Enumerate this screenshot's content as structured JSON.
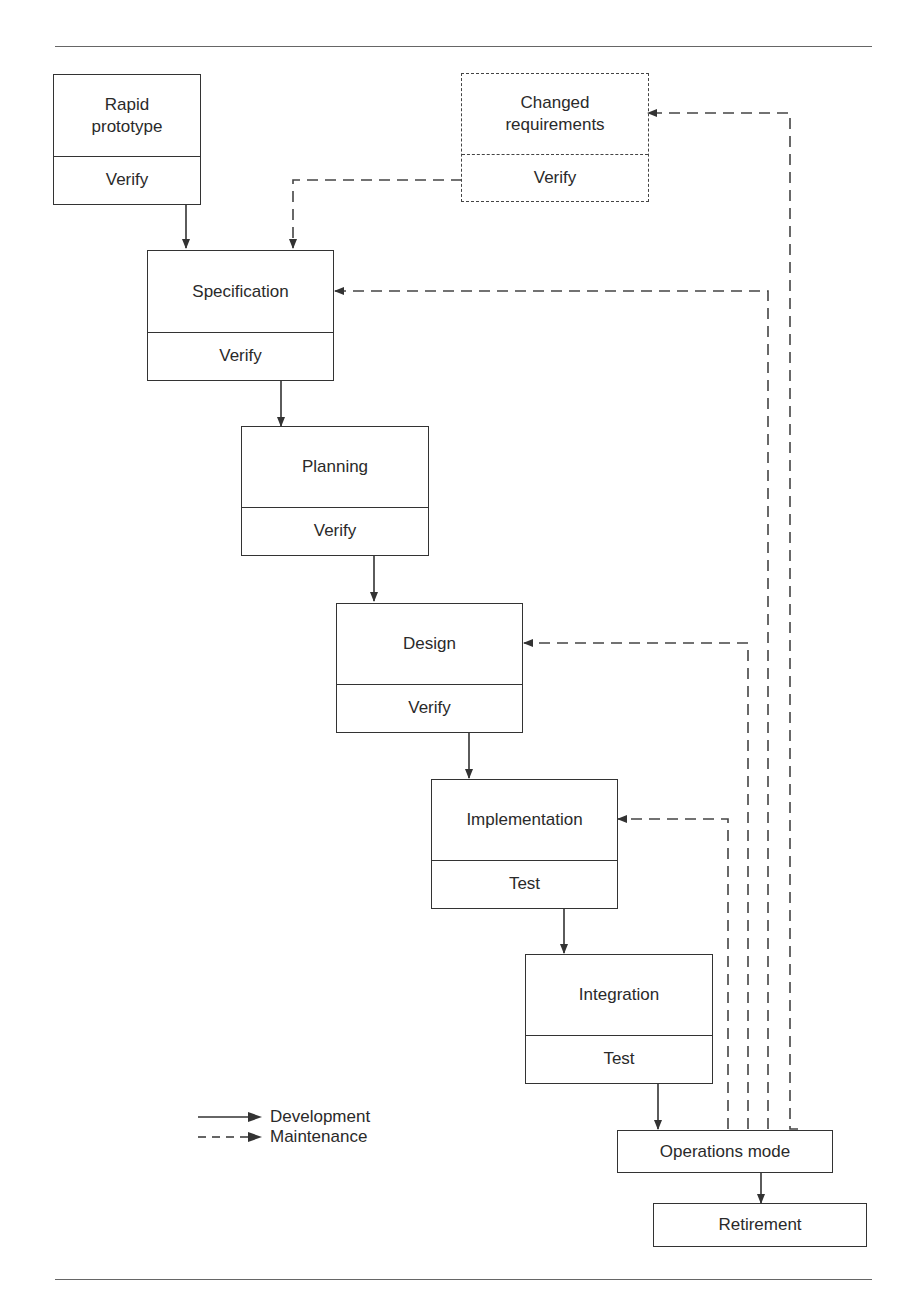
{
  "diagram": {
    "type": "rapid-prototyping life-cycle model",
    "nodes": [
      {
        "id": "rapid_prototype",
        "title": "Rapid\nprototype",
        "sub": "Verify",
        "style": "solid"
      },
      {
        "id": "changed_requirements",
        "title": "Changed\nrequirements",
        "sub": "Verify",
        "style": "dashed"
      },
      {
        "id": "specification",
        "title": "Specification",
        "sub": "Verify",
        "style": "solid"
      },
      {
        "id": "planning",
        "title": "Planning",
        "sub": "Verify",
        "style": "solid"
      },
      {
        "id": "design",
        "title": "Design",
        "sub": "Verify",
        "style": "solid"
      },
      {
        "id": "implementation",
        "title": "Implementation",
        "sub": "Test",
        "style": "solid"
      },
      {
        "id": "integration",
        "title": "Integration",
        "sub": "Test",
        "style": "solid"
      },
      {
        "id": "operations_mode",
        "title": "Operations mode",
        "style": "solid"
      },
      {
        "id": "retirement",
        "title": "Retirement",
        "style": "solid"
      }
    ],
    "edges": [
      {
        "from": "rapid_prototype",
        "to": "specification",
        "kind": "development"
      },
      {
        "from": "specification",
        "to": "planning",
        "kind": "development"
      },
      {
        "from": "planning",
        "to": "design",
        "kind": "development"
      },
      {
        "from": "design",
        "to": "implementation",
        "kind": "development"
      },
      {
        "from": "implementation",
        "to": "integration",
        "kind": "development"
      },
      {
        "from": "integration",
        "to": "operations_mode",
        "kind": "development"
      },
      {
        "from": "operations_mode",
        "to": "retirement",
        "kind": "development"
      },
      {
        "from": "changed_requirements",
        "to": "specification",
        "kind": "maintenance"
      },
      {
        "from": "operations_mode",
        "to": "changed_requirements",
        "kind": "maintenance"
      },
      {
        "from": "operations_mode",
        "to": "specification",
        "kind": "maintenance"
      },
      {
        "from": "operations_mode",
        "to": "design",
        "kind": "maintenance"
      },
      {
        "from": "operations_mode",
        "to": "implementation",
        "kind": "maintenance"
      }
    ]
  },
  "boxes": {
    "rapid_prototype": {
      "title": "Rapid prototype",
      "sub": "Verify"
    },
    "changed_requirements": {
      "title": "Changed requirements",
      "sub": "Verify"
    },
    "specification": {
      "title": "Specification",
      "sub": "Verify"
    },
    "planning": {
      "title": "Planning",
      "sub": "Verify"
    },
    "design": {
      "title": "Design",
      "sub": "Verify"
    },
    "implementation": {
      "title": "Implementation",
      "sub": "Test"
    },
    "integration": {
      "title": "Integration",
      "sub": "Test"
    },
    "operations_mode": {
      "title": "Operations mode"
    },
    "retirement": {
      "title": "Retirement"
    }
  },
  "legend": {
    "development": "Development",
    "maintenance": "Maintenance"
  }
}
